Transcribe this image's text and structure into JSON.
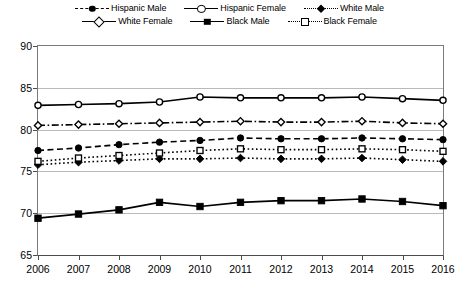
{
  "chart_data": {
    "type": "line",
    "title": "",
    "subtitle": "",
    "xlabel": "",
    "ylabel": "",
    "grid": true,
    "legend_position": "top",
    "x": [
      2006,
      2007,
      2008,
      2009,
      2010,
      2011,
      2012,
      2013,
      2014,
      2015,
      2016
    ],
    "categories": [
      "2006",
      "2007",
      "2008",
      "2009",
      "2010",
      "2011",
      "2012",
      "2013",
      "2014",
      "2015",
      "2016"
    ],
    "xlim": [
      2006,
      2016
    ],
    "ylim": [
      65,
      90
    ],
    "yticks": [
      65,
      70,
      75,
      80,
      85,
      90
    ],
    "xticks": [
      "2006",
      "2007",
      "2008",
      "2009",
      "2010",
      "2011",
      "2012",
      "2013",
      "2014",
      "2015",
      "2016"
    ],
    "series": [
      {
        "name": "Hispanic Male",
        "marker": "circle-filled",
        "linestyle": "dashed",
        "color": "#000000",
        "values": [
          77.5,
          77.8,
          78.2,
          78.5,
          78.7,
          79.0,
          78.9,
          78.9,
          79.0,
          78.9,
          78.8
        ]
      },
      {
        "name": "Hispanic Female",
        "marker": "circle-open",
        "linestyle": "solid",
        "color": "#000000",
        "values": [
          82.9,
          83.0,
          83.1,
          83.3,
          83.9,
          83.8,
          83.8,
          83.8,
          83.9,
          83.7,
          83.5
        ]
      },
      {
        "name": "White Male",
        "marker": "diamond-filled",
        "linestyle": "dotted",
        "color": "#000000",
        "values": [
          75.8,
          76.1,
          76.3,
          76.5,
          76.5,
          76.6,
          76.5,
          76.5,
          76.6,
          76.4,
          76.2
        ]
      },
      {
        "name": "White Female",
        "marker": "diamond-open",
        "linestyle": "dashdot",
        "color": "#000000",
        "values": [
          80.5,
          80.6,
          80.7,
          80.8,
          80.9,
          81.0,
          80.9,
          80.9,
          81.0,
          80.8,
          80.7
        ]
      },
      {
        "name": "Black Male",
        "marker": "square-filled",
        "linestyle": "solid",
        "color": "#000000",
        "values": [
          69.4,
          69.9,
          70.4,
          71.3,
          70.8,
          71.3,
          71.5,
          71.5,
          71.7,
          71.4,
          70.9
        ]
      },
      {
        "name": "Black Female",
        "marker": "square-open",
        "linestyle": "dotted",
        "color": "#000000",
        "values": [
          76.2,
          76.6,
          76.9,
          77.2,
          77.5,
          77.7,
          77.6,
          77.6,
          77.7,
          77.6,
          77.4
        ]
      }
    ]
  },
  "legend": {
    "rows": [
      [
        {
          "label": "Hispanic Male",
          "marker": "circle-filled",
          "linestyle": "dashed"
        },
        {
          "label": "Hispanic Female",
          "marker": "circle-open",
          "linestyle": "solid"
        },
        {
          "label": "White Male",
          "marker": "diamond-filled",
          "linestyle": "dotted"
        }
      ],
      [
        {
          "label": "White Female",
          "marker": "diamond-open",
          "linestyle": "dashdot"
        },
        {
          "label": "Black Male",
          "marker": "square-filled",
          "linestyle": "solid"
        },
        {
          "label": "Black Female",
          "marker": "square-open",
          "linestyle": "dotted"
        }
      ]
    ]
  },
  "axes": {
    "y_labels": [
      "90",
      "85",
      "80",
      "75",
      "70",
      "65"
    ],
    "x_labels": [
      "2006",
      "2007",
      "2008",
      "2009",
      "2010",
      "2011",
      "2012",
      "2013",
      "2014",
      "2015",
      "2016"
    ]
  },
  "colors": {
    "ink": "#000000",
    "grid": "#b9b9b9",
    "axis": "#4d4d4d",
    "plot_border": "#7a7a7a",
    "background": "#ffffff"
  }
}
